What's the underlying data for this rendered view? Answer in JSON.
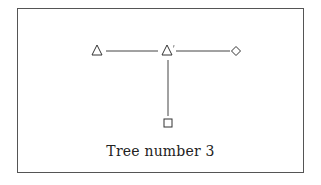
{
  "caption": "Tree number 3",
  "diagram": {
    "nodes": [
      {
        "id": "left",
        "shape": "triangle",
        "x": 97,
        "y": 51
      },
      {
        "id": "center",
        "shape": "triangle",
        "marked": true,
        "x": 167,
        "y": 51
      },
      {
        "id": "right",
        "shape": "diamond",
        "x": 236,
        "y": 51
      },
      {
        "id": "bottom",
        "shape": "square",
        "x": 168,
        "y": 123
      }
    ],
    "edges": [
      [
        "left",
        "center"
      ],
      [
        "center",
        "right"
      ],
      [
        "center",
        "bottom"
      ]
    ],
    "stroke_color": "#444444"
  }
}
